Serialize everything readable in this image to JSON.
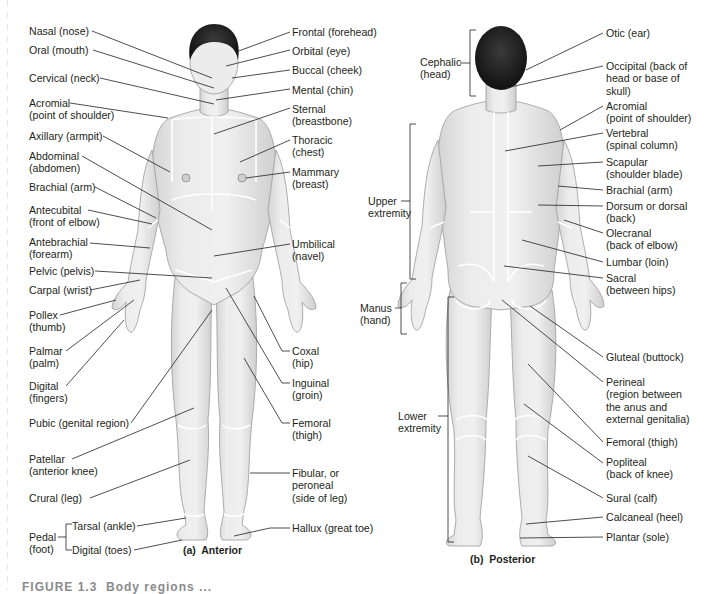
{
  "figure": {
    "anterior_caption": "(a)  Anterior",
    "posterior_caption": "(b)  Posterior",
    "figure_caption_partial": "FIGURE 1.3  Body regions ..."
  },
  "colors": {
    "skin": "#e9e9e9",
    "skin_shadow": "#cfcfcf",
    "hair": "#1e1e1e",
    "leader_line": "#231f20",
    "region_boundary": "#ffffff",
    "text": "#231f20"
  },
  "anterior": {
    "left_labels": [
      {
        "text": "Nasal (nose)"
      },
      {
        "text": "Oral (mouth)"
      },
      {
        "text": "Cervical (neck)"
      },
      {
        "text": "Acromial\n(point of shoulder)"
      },
      {
        "text": "Axillary (armpit)"
      },
      {
        "text": "Abdominal\n(abdomen)"
      },
      {
        "text": "Brachial (arm)"
      },
      {
        "text": "Antecubital\n(front of elbow)"
      },
      {
        "text": "Antebrachial\n(forearm)"
      },
      {
        "text": "Pelvic (pelvis)"
      },
      {
        "text": "Carpal (wrist)"
      },
      {
        "text": "Pollex\n(thumb)"
      },
      {
        "text": "Palmar\n(palm)"
      },
      {
        "text": "Digital\n(fingers)"
      },
      {
        "text": "Pubic (genital region)"
      },
      {
        "text": "Patellar\n(anterior knee)"
      },
      {
        "text": "Crural (leg)"
      }
    ],
    "pedal_group": {
      "label": "Pedal\n(foot)",
      "items": [
        {
          "text": "Tarsal (ankle)"
        },
        {
          "text": "Digital (toes)"
        }
      ]
    },
    "right_labels": [
      {
        "text": "Frontal (forehead)"
      },
      {
        "text": "Orbital (eye)"
      },
      {
        "text": "Buccal (cheek)"
      },
      {
        "text": "Mental (chin)"
      },
      {
        "text": "Sternal\n(breastbone)"
      },
      {
        "text": "Thoracic\n(chest)"
      },
      {
        "text": "Mammary\n(breast)"
      },
      {
        "text": "Umbilical\n(navel)"
      },
      {
        "text": "Coxal\n(hip)"
      },
      {
        "text": "Inguinal\n(groin)"
      },
      {
        "text": "Femoral\n(thigh)"
      },
      {
        "text": "Fibular, or\nperoneal\n(side of leg)"
      },
      {
        "text": "Hallux (great toe)"
      }
    ]
  },
  "posterior": {
    "bracket_labels": [
      {
        "text": "Cephalic\n(head)"
      },
      {
        "text": "Upper\nextremity"
      },
      {
        "text": "Manus\n(hand)"
      },
      {
        "text": "Lower\nextremity"
      }
    ],
    "right_labels": [
      {
        "text": "Otic (ear)"
      },
      {
        "text": "Occipital (back of\nhead or base of\nskull)"
      },
      {
        "text": "Acromial\n(point of shoulder)"
      },
      {
        "text": "Vertebral\n(spinal column)"
      },
      {
        "text": "Scapular\n(shoulder blade)"
      },
      {
        "text": "Brachial (arm)"
      },
      {
        "text": "Dorsum or dorsal\n(back)"
      },
      {
        "text": "Olecranal\n(back of elbow)"
      },
      {
        "text": "Lumbar (loin)"
      },
      {
        "text": "Sacral\n(between hips)"
      },
      {
        "text": "Gluteal (buttock)"
      },
      {
        "text": "Perineal\n(region between\nthe anus and\nexternal genitalia)"
      },
      {
        "text": "Femoral (thigh)"
      },
      {
        "text": "Popliteal\n(back of knee)"
      },
      {
        "text": "Sural (calf)"
      },
      {
        "text": "Calcaneal (heel)"
      },
      {
        "text": "Plantar (sole)"
      }
    ]
  }
}
